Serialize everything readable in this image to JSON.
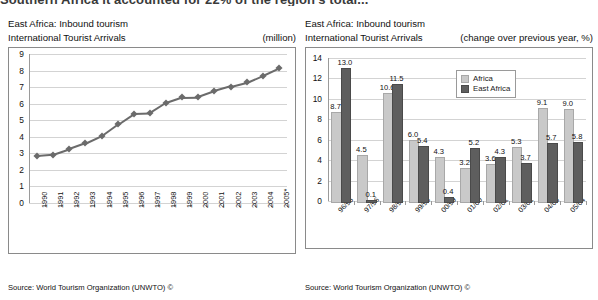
{
  "page": {
    "cut_headline": "Southern Africa it accounted for 22% of the region's total..."
  },
  "left_panel": {
    "title_line1": "East Africa: Inbound tourism",
    "title_line2": "International Tourist Arrivals",
    "unit": "(million)",
    "source": "Source: World Tourism Organization (UNWTO) ©"
  },
  "right_panel": {
    "title_line1": "East Africa: Inbound tourism",
    "title_line2": "International Tourist Arrivals",
    "unit": "(change over previous year, %)",
    "source": "Source: World Tourism Organization (UNWTO) ©",
    "legend": [
      "Africa",
      "East Africa"
    ]
  },
  "chart_data": [
    {
      "type": "line",
      "title": "East Africa: Inbound tourism – International Tourist Arrivals",
      "xlabel": "",
      "ylabel": "",
      "unit": "million",
      "ylim": [
        0,
        9
      ],
      "yticks": [
        0,
        1,
        2,
        3,
        4,
        5,
        6,
        7,
        8,
        9
      ],
      "grid": true,
      "legend": "none",
      "categories": [
        "1990",
        "1991",
        "1992",
        "1993",
        "1994",
        "1995",
        "1996",
        "1997",
        "1998",
        "1999",
        "2000",
        "2001",
        "2002",
        "2003",
        "2004",
        "2005*"
      ],
      "values": [
        2.85,
        2.92,
        3.25,
        3.6,
        4.05,
        4.75,
        5.4,
        5.43,
        6.05,
        6.38,
        6.4,
        6.75,
        7.03,
        7.28,
        7.7,
        8.15
      ]
    },
    {
      "type": "bar",
      "title": "East Africa: Inbound tourism – International Tourist Arrivals",
      "xlabel": "",
      "ylabel": "",
      "unit": "change over previous year, %",
      "ylim": [
        0,
        14
      ],
      "yticks": [
        0,
        2,
        4,
        6,
        8,
        10,
        12,
        14
      ],
      "grid": true,
      "legend": "inside-top-right",
      "categories": [
        "96/95",
        "97/96",
        "98/97",
        "99/98",
        "00/99",
        "01/00",
        "02/01",
        "03/02",
        "04/03",
        "05/04"
      ],
      "series": [
        {
          "name": "Africa",
          "values": [
            8.7,
            4.5,
            10.6,
            6.0,
            4.3,
            3.2,
            3.6,
            5.3,
            9.1,
            9.0
          ]
        },
        {
          "name": "East Africa",
          "values": [
            13.0,
            0.1,
            11.5,
            5.4,
            0.4,
            5.2,
            4.3,
            3.7,
            5.7,
            5.8
          ]
        }
      ]
    }
  ],
  "colors": {
    "africa": "#c9c9c9",
    "east_africa": "#5e5e5e",
    "line": "#6b6b6b",
    "grid": "#d3d3d3",
    "border": "#8a8a8a"
  }
}
